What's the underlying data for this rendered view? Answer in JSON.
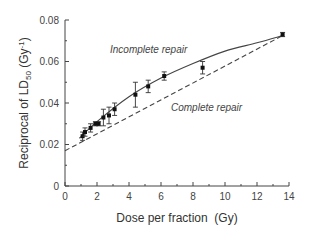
{
  "chart_data": {
    "type": "scatter",
    "title": "",
    "xlabel": "Dose per fraction  (Gy)",
    "ylabel": "Reciprocal of LD50 (Gy-1)",
    "ylabel_parts": {
      "main": "Reciprocal  of  LD",
      "sub": "50",
      "unit": " (Gy",
      "sup": "-1",
      "close": ")"
    },
    "xlim": [
      0,
      14
    ],
    "ylim": [
      0,
      0.08
    ],
    "xticks": [
      0,
      2,
      4,
      6,
      8,
      10,
      12,
      14
    ],
    "xtick_labels": [
      "0",
      "2",
      "4",
      "6",
      "8",
      "10",
      "12",
      "14"
    ],
    "yticks": [
      0,
      0.02,
      0.04,
      0.06,
      0.08
    ],
    "ytick_labels": [
      "0",
      "0.02",
      "0.04",
      "0.06",
      "0.08"
    ],
    "grid": false,
    "series": [
      {
        "name": "Measured",
        "type": "scatter",
        "x": [
          1.1,
          1.25,
          1.6,
          1.9,
          2.1,
          2.4,
          2.75,
          3.1,
          4.4,
          5.2,
          6.2,
          8.6,
          13.6
        ],
        "y": [
          0.024,
          0.026,
          0.028,
          0.03,
          0.03,
          0.033,
          0.034,
          0.037,
          0.044,
          0.048,
          0.053,
          0.057,
          0.073
        ],
        "err": [
          0.002,
          0.002,
          0.002,
          0.001,
          0.001,
          0.004,
          0.004,
          0.003,
          0.006,
          0.003,
          0.002,
          0.003,
          0.001
        ]
      },
      {
        "name": "Incomplete repair",
        "type": "line",
        "style": "solid",
        "x": [
          0.9,
          2,
          4,
          6,
          8,
          10,
          12,
          13.6
        ],
        "y": [
          0.023,
          0.031,
          0.043,
          0.052,
          0.059,
          0.065,
          0.069,
          0.0725
        ]
      },
      {
        "name": "Complete repair",
        "type": "line",
        "style": "dashed",
        "x": [
          0,
          13.6
        ],
        "y": [
          0.017,
          0.0725
        ]
      }
    ],
    "annotations": [
      {
        "text": "Incomplete repair",
        "x": 4.0,
        "y": 0.068
      },
      {
        "text": "Complete repair",
        "x": 6.6,
        "y": 0.038
      }
    ]
  }
}
